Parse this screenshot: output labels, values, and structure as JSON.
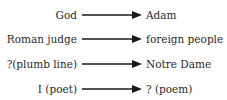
{
  "diagram": {
    "rows": [
      {
        "source": "God",
        "target": "Adam"
      },
      {
        "source": "Roman judge",
        "target": "foreign people"
      },
      {
        "source": "?(plumb line)",
        "target": "Notre Dame"
      },
      {
        "source": "I (poet)",
        "target": "? (poem)"
      }
    ],
    "arrow_color": "#1a1a1a"
  }
}
